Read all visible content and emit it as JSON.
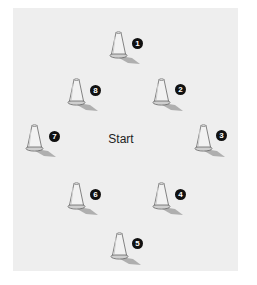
{
  "diagram": {
    "type": "cone-drill-layout",
    "center_label": "Start",
    "center_position": {
      "x": 121,
      "y": 139
    },
    "colors": {
      "background": "#eeeeee",
      "cone_body": "#f2f2f2",
      "cone_outline": "#666666",
      "cone_base": "#cfcfcf",
      "shadow": "#9a9a9a",
      "badge": "#111111",
      "badge_text": "#ffffff"
    },
    "cones": [
      {
        "label": "1",
        "x": 110,
        "y": 31,
        "badge_x": 132,
        "badge_y": 38
      },
      {
        "label": "2",
        "x": 153,
        "y": 78,
        "badge_x": 175,
        "badge_y": 84
      },
      {
        "label": "3",
        "x": 195,
        "y": 124,
        "badge_x": 216,
        "badge_y": 130
      },
      {
        "label": "4",
        "x": 153,
        "y": 182,
        "badge_x": 175,
        "badge_y": 189
      },
      {
        "label": "5",
        "x": 111,
        "y": 232,
        "badge_x": 132,
        "badge_y": 238
      },
      {
        "label": "6",
        "x": 68,
        "y": 182,
        "badge_x": 90,
        "badge_y": 189
      },
      {
        "label": "7",
        "x": 26,
        "y": 124,
        "badge_x": 49,
        "badge_y": 131
      },
      {
        "label": "8",
        "x": 68,
        "y": 78,
        "badge_x": 90,
        "badge_y": 85
      }
    ]
  }
}
